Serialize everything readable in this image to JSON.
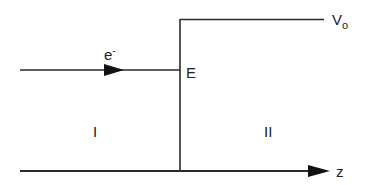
{
  "diagram": {
    "labels": {
      "electron": "e",
      "electron_sup": "-",
      "energy": "E",
      "potential": "V",
      "potential_sub": "o",
      "region_1": "I",
      "region_2": "II",
      "axis": "z"
    },
    "colors": {
      "line": "#2a2a2a",
      "background": "#ffffff"
    }
  }
}
